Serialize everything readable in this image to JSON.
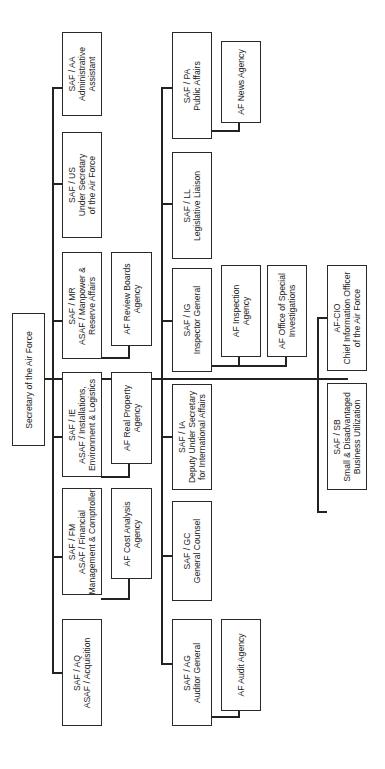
{
  "root": {
    "label": "Secretary of the Air Force"
  },
  "top_row": [
    {
      "id": "aa",
      "lines": [
        "SAF / AA",
        "Administrative",
        "Assistant"
      ]
    },
    {
      "id": "us",
      "lines": [
        "SAF / US",
        "Under Secretary",
        "of the Air Force"
      ]
    },
    {
      "id": "mr",
      "lines": [
        "SAF / MR",
        "ASAF / Manpower &",
        "Reserve Affairs"
      ]
    },
    {
      "id": "ie",
      "lines": [
        "SAF / IE",
        "ASAF / Installations,",
        "Environment & Logistics"
      ]
    },
    {
      "id": "fm",
      "lines": [
        "SAF / FM",
        "ASAF / Financial",
        "Management & Comptroller"
      ]
    },
    {
      "id": "aq",
      "lines": [
        "SAF / AQ",
        "ASAF / Acquisition"
      ]
    }
  ],
  "top_agencies": [
    {
      "id": "review",
      "lines": [
        "AF Review Boards",
        "Agency"
      ]
    },
    {
      "id": "realprop",
      "lines": [
        "AF Real Property",
        "Agency"
      ]
    },
    {
      "id": "costanalysis",
      "lines": [
        "AF Cost Analysis",
        "Agency"
      ]
    }
  ],
  "middle_row": [
    {
      "id": "pa",
      "lines": [
        "SAF / PA",
        "Public Affairs"
      ]
    },
    {
      "id": "ll",
      "lines": [
        "SAF / LL",
        "Legislative Liaison"
      ]
    },
    {
      "id": "ig",
      "lines": [
        "SAF / IG",
        "Inspector General"
      ]
    },
    {
      "id": "ia",
      "lines": [
        "SAF / IA",
        "Deputy Under Secretary",
        "for International Affairs"
      ]
    },
    {
      "id": "gc",
      "lines": [
        "SAF / GC",
        "General Counsel"
      ]
    },
    {
      "id": "ag",
      "lines": [
        "SAF / AG",
        "Auditor General"
      ]
    }
  ],
  "middle_agencies": [
    {
      "id": "news",
      "lines": [
        "AF News Agency"
      ]
    },
    {
      "id": "inspection",
      "lines": [
        "AF Inspection",
        "Agency"
      ]
    },
    {
      "id": "osi",
      "lines": [
        "AF Office of Special",
        "Investigations"
      ]
    },
    {
      "id": "audit",
      "lines": [
        "AF Audit Agency"
      ]
    }
  ],
  "right_row": [
    {
      "id": "cio",
      "lines": [
        "AF-CIO",
        "Chief Information Officer",
        "of the Air Force"
      ]
    },
    {
      "id": "sb",
      "lines": [
        "SAF / SB",
        "Small & Disadvantaged",
        "Business Utilization"
      ]
    }
  ]
}
